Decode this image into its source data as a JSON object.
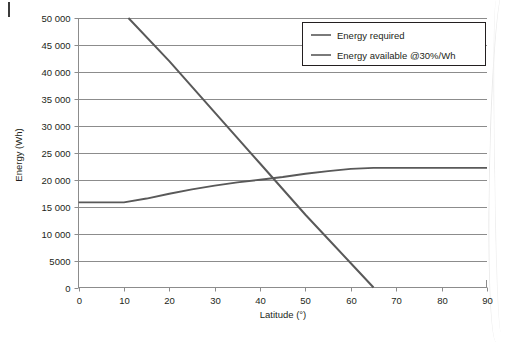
{
  "chart_data": {
    "type": "line",
    "title": "",
    "xlabel": "Latitude (°)",
    "ylabel": "Energy (Wh)",
    "xlim": [
      0,
      90
    ],
    "ylim": [
      0,
      50000
    ],
    "xticks": [
      "0",
      "10",
      "20",
      "30",
      "40",
      "50",
      "60",
      "70",
      "80",
      "90"
    ],
    "xtick_values": [
      0,
      10,
      20,
      30,
      40,
      50,
      60,
      70,
      80,
      90
    ],
    "yticks": [
      "0",
      "5000",
      "10 000",
      "15 000",
      "20 000",
      "25 000",
      "30 000",
      "35 000",
      "40 000",
      "45 000",
      "50 000"
    ],
    "ytick_values": [
      0,
      5000,
      10000,
      15000,
      20000,
      25000,
      30000,
      35000,
      40000,
      45000,
      50000
    ],
    "grid": "horizontal",
    "legend_position": "top-right",
    "series": [
      {
        "name": "Energy required",
        "color": "#595959",
        "x": [
          11,
          20,
          30,
          40,
          50,
          55,
          60,
          65
        ],
        "values": [
          50000,
          42000,
          32500,
          23000,
          13500,
          9000,
          4500,
          0
        ]
      },
      {
        "name": "Energy available @30%/Wh",
        "color": "#595959",
        "x": [
          0,
          5,
          10,
          15,
          20,
          25,
          30,
          35,
          40,
          45,
          50,
          55,
          60,
          65,
          70,
          75,
          80,
          85,
          90
        ],
        "values": [
          15800,
          15800,
          15800,
          16500,
          17400,
          18200,
          18900,
          19500,
          20000,
          20500,
          21100,
          21600,
          22000,
          22200,
          22200,
          22200,
          22200,
          22200,
          22200
        ]
      }
    ]
  },
  "legend": {
    "items": [
      {
        "label": "Energy required"
      },
      {
        "label": "Energy available @30%/Wh"
      }
    ]
  },
  "axes": {
    "x_title": "Latitude (°)",
    "y_title": "Energy (Wh)"
  }
}
